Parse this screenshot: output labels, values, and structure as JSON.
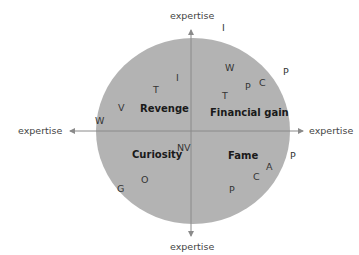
{
  "diagram": {
    "circle_fill": "#b3b3b3",
    "axis_color": "#8a8a8a",
    "axes": {
      "top": "expertise",
      "bottom": "expertise",
      "left": "expertise",
      "right": "expertise"
    },
    "quadrants": {
      "top_left": "Revenge",
      "top_right": "Financial gain",
      "bottom_left": "Curiosity",
      "bottom_right": "Fame"
    },
    "markers": [
      {
        "label": "I",
        "x": 222,
        "y": 23
      },
      {
        "label": "W",
        "x": 225,
        "y": 63
      },
      {
        "label": "P",
        "x": 283,
        "y": 67
      },
      {
        "label": "C",
        "x": 259,
        "y": 78
      },
      {
        "label": "P",
        "x": 245,
        "y": 82
      },
      {
        "label": "T",
        "x": 222,
        "y": 91
      },
      {
        "label": "I",
        "x": 176,
        "y": 73
      },
      {
        "label": "T",
        "x": 153,
        "y": 85
      },
      {
        "label": "V",
        "x": 118,
        "y": 103
      },
      {
        "label": "W",
        "x": 95,
        "y": 116
      },
      {
        "label": "NV",
        "x": 177,
        "y": 143
      },
      {
        "label": "P",
        "x": 290,
        "y": 151
      },
      {
        "label": "A",
        "x": 266,
        "y": 162
      },
      {
        "label": "C",
        "x": 253,
        "y": 172
      },
      {
        "label": "O",
        "x": 141,
        "y": 175
      },
      {
        "label": "P",
        "x": 229,
        "y": 185
      },
      {
        "label": "G",
        "x": 117,
        "y": 184
      }
    ]
  }
}
